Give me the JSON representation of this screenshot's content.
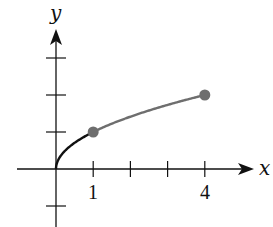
{
  "chart_data": {
    "type": "line",
    "title": "",
    "xlabel": "x",
    "ylabel": "y",
    "xlim": [
      -1,
      5.3
    ],
    "ylim": [
      -1.6,
      3.7
    ],
    "grid": false,
    "x_tick_labels": [
      {
        "value": 1,
        "label": "1"
      },
      {
        "value": 4,
        "label": "4"
      }
    ],
    "x_ticks": [
      1,
      2,
      3,
      4
    ],
    "y_ticks": [
      -1,
      1,
      2,
      3
    ],
    "function": "y = sqrt(x)",
    "series": [
      {
        "name": "sqrt(x) on [0,1]",
        "color": "#111111",
        "x": [
          0,
          0.0625,
          0.25,
          0.5,
          1
        ],
        "values": [
          0,
          0.25,
          0.5,
          0.7071,
          1
        ]
      },
      {
        "name": "sqrt(x) on [1,4]",
        "color": "#6e6e6e",
        "x": [
          1,
          1.5,
          2,
          2.5,
          3,
          3.5,
          4
        ],
        "values": [
          1,
          1.2247,
          1.4142,
          1.5811,
          1.7321,
          1.8708,
          2
        ]
      }
    ],
    "points": [
      {
        "x": 1,
        "y": 1,
        "color": "#6e6e6e"
      },
      {
        "x": 4,
        "y": 2,
        "color": "#6e6e6e"
      }
    ]
  },
  "colors": {
    "axis": "#111111",
    "curve_dark": "#111111",
    "curve_gray": "#6e6e6e",
    "point": "#6e6e6e"
  }
}
